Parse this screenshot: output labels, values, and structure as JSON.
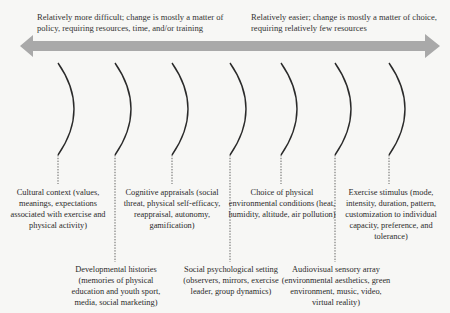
{
  "arrow": {
    "left_caption": "Relatively more difficult; change is mostly a matter of policy, requiring resources, time, and/or training",
    "right_caption": "Relatively easier; change is mostly a matter of choice, requiring relatively few resources",
    "color": "#a9a9a9"
  },
  "factors": [
    {
      "label": "Cultural context (values, meanings, expectations associated with exercise and physical activity)",
      "position": "upper"
    },
    {
      "label": "Developmental histories (memories of physical education and youth sport, media, social marketing)",
      "position": "lower"
    },
    {
      "label": "Cognitive appraisals (social threat, physical self-efficacy, reappraisal, autonomy, gamification)",
      "position": "upper"
    },
    {
      "label": "Social psychological setting (observers, mirrors, exercise leader, group dynamics)",
      "position": "lower"
    },
    {
      "label": "Choice of physical environmental conditions (heat, humidity, altitude, air pollution)",
      "position": "upper"
    },
    {
      "label": "Audiovisual sensory array (environmental aesthetics, green environment, music, video, virtual reality)",
      "position": "lower"
    },
    {
      "label": "Exercise stimulus (mode, intensity, duration, pattern, customization to individual capacity, preference, and tolerance)",
      "position": "upper"
    }
  ]
}
